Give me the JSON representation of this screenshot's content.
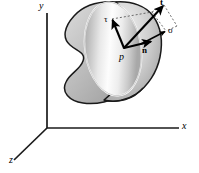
{
  "figure": {
    "background_color": "#ffffff"
  },
  "axes": {
    "origin": {
      "x": 47,
      "y": 128
    },
    "color": "#1a1a1a",
    "items": [
      {
        "id": "y",
        "label": "y",
        "direction": "up",
        "tip": {
          "x": 47,
          "y": 12
        }
      },
      {
        "id": "x",
        "label": "x",
        "direction": "right",
        "tip": {
          "x": 180,
          "y": 128
        }
      },
      {
        "id": "z",
        "label": "z",
        "direction": "down-left",
        "tip": {
          "x": 14,
          "y": 160
        }
      }
    ]
  },
  "body": {
    "name": "continuum-body",
    "shape": "kidney-blob",
    "outline_color": "#1a1a1a",
    "fill_light": "#f2f2f2",
    "fill_mid": "#c8c8c8",
    "fill_dark": "#9a9a9a"
  },
  "cut_plane": {
    "name": "cut-section-ellipse",
    "shape": "ellipse",
    "center": {
      "x": 113,
      "y": 49
    },
    "rx": 28,
    "ry": 47,
    "rotation_deg": -8,
    "edge_color": "#ffffff",
    "fill_light": "#fdfdfd",
    "fill_dark": "#8f8f8f"
  },
  "point": {
    "name": "point-p",
    "label": "p",
    "x": 124,
    "y": 48
  },
  "vectors": [
    {
      "id": "t",
      "label": "t",
      "style": "bold",
      "description": "traction / stress vector",
      "from": {
        "x": 124,
        "y": 48
      },
      "to": {
        "x": 164,
        "y": 5
      }
    },
    {
      "id": "tau",
      "label": "τ",
      "style": "greek",
      "description": "shear stress component tangent to the cut plane",
      "from": {
        "x": 124,
        "y": 48
      },
      "to": {
        "x": 112,
        "y": 19
      }
    },
    {
      "id": "n",
      "label": "n",
      "style": "bold",
      "description": "unit normal to the cut plane",
      "from": {
        "x": 124,
        "y": 48
      },
      "to": {
        "x": 152,
        "y": 41
      }
    },
    {
      "id": "sigma",
      "label": "σ",
      "style": "greek",
      "description": "normal stress component along n",
      "from": {
        "x": 141,
        "y": 44
      },
      "to": {
        "x": 166,
        "y": 31
      }
    }
  ],
  "construction_lines": {
    "name": "dashed-parallelogram",
    "color": "#555555",
    "dash": "2 2",
    "segments": [
      {
        "from": {
          "x": 112,
          "y": 19
        },
        "to": {
          "x": 152,
          "y": 12
        }
      },
      {
        "from": {
          "x": 152,
          "y": 12
        },
        "to": {
          "x": 164,
          "y": 5
        }
      },
      {
        "from": {
          "x": 164,
          "y": 5
        },
        "to": {
          "x": 177,
          "y": 26
        }
      },
      {
        "from": {
          "x": 177,
          "y": 26
        },
        "to": {
          "x": 166,
          "y": 31
        }
      },
      {
        "from": {
          "x": 152,
          "y": 12
        },
        "to": {
          "x": 166,
          "y": 31
        }
      }
    ]
  }
}
